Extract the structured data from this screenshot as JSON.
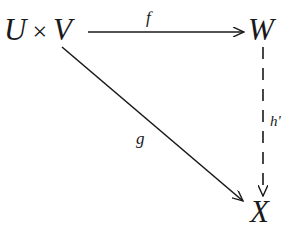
{
  "diagram": {
    "type": "commutative-diagram",
    "nodes": {
      "domain": {
        "left": "U",
        "operator": "×",
        "right": "V"
      },
      "codomain_top": "W",
      "codomain_bottom": "X"
    },
    "morphisms": {
      "f": {
        "label": "f",
        "from": "U × V",
        "to": "W",
        "style": "solid"
      },
      "g": {
        "label": "g",
        "from": "U × V",
        "to": "X",
        "style": "solid"
      },
      "h": {
        "label": "h'",
        "from": "W",
        "to": "X",
        "style": "dashed"
      }
    }
  }
}
